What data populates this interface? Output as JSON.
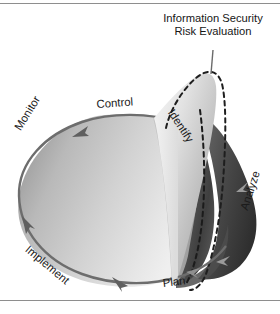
{
  "figure": {
    "title": "Information Security Risk Evaluation",
    "title_line_1": "Information Security",
    "title_line_2": "Risk Evaluation",
    "cycle_labels": {
      "control": "Control",
      "monitor": "Monitor",
      "implement": "Implement",
      "plan": "Plan"
    },
    "evaluation_labels": {
      "identify": "Identify",
      "analyze": "Analyze"
    },
    "colors": {
      "background": "#ffffff",
      "frame_line": "#8e8e8e",
      "text": "#1b1b1b",
      "disc_light": "#e8e8e8",
      "disc_mid": "#c9c9c9",
      "disc_dark": "#9d9d9d",
      "disc_edge": "#6d6d6d",
      "cone_light": "#ededed",
      "cone_mid": "#b4b4b4",
      "cone_shadow_dark": "#3c3c3c",
      "cone_shadow_mid": "#707070",
      "dashed_outline": "#1e1e1e",
      "leader_line": "#6a6a6a",
      "arrow": "#5f5f5f"
    }
  }
}
